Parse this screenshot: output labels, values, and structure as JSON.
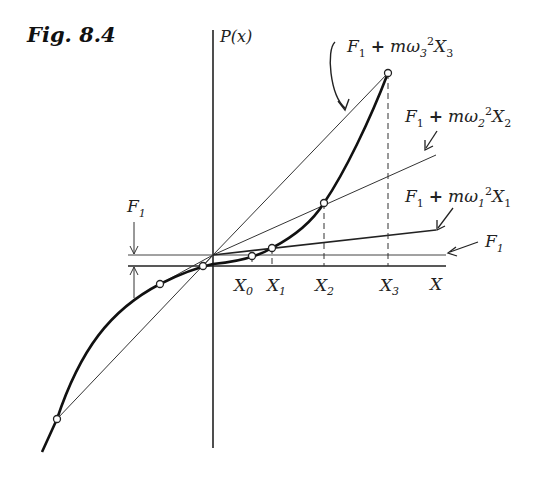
{
  "figure": {
    "title": "Fig. 8.4",
    "y_axis_label": "P(x)",
    "x_axis_label": "X"
  },
  "labels": {
    "f1_left": "F1",
    "f1_right": "F1",
    "line3": {
      "F": "F",
      "sub1": "1",
      "plus": "+",
      "m": "mω",
      "wsub": "3",
      "sq": "2",
      "X": "X",
      "xsub": "3"
    },
    "line2": {
      "F": "F",
      "sub1": "1",
      "plus": "+",
      "m": "mω",
      "wsub": "2",
      "sq": "2",
      "X": "X",
      "xsub": "2"
    },
    "line1": {
      "F": "F",
      "sub1": "1",
      "plus": "+",
      "m": "mω",
      "wsub": "1",
      "sq": "2",
      "X": "X",
      "xsub": "1"
    }
  },
  "ticks": [
    {
      "name": "X",
      "sub": "0"
    },
    {
      "name": "X",
      "sub": "1"
    },
    {
      "name": "X",
      "sub": "2"
    },
    {
      "name": "X",
      "sub": "3"
    }
  ],
  "colors": {
    "ink": "#222222",
    "curve": "#111111",
    "thin": "#333333"
  }
}
